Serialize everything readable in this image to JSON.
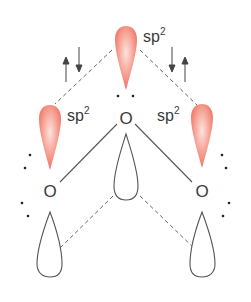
{
  "diagram": {
    "colors": {
      "lobe_fill": "#f0796a",
      "lobe_highlight": "#fde3df",
      "line": "#555555",
      "text": "#3a3a3a"
    },
    "atoms": {
      "center": {
        "symbol": "O"
      },
      "left": {
        "symbol": "O"
      },
      "right": {
        "symbol": "O"
      }
    },
    "labels": {
      "top": {
        "base": "sp",
        "sup": "2"
      },
      "left": {
        "base": "sp",
        "sup": "2"
      },
      "right": {
        "base": "sp",
        "sup": "2"
      }
    },
    "spin_arrows": {
      "left": [
        "up",
        "down"
      ],
      "right": [
        "down",
        "up"
      ]
    }
  }
}
